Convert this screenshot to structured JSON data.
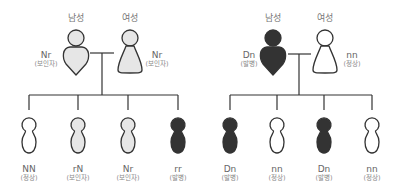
{
  "colors": {
    "stroke": "#333333",
    "affected": "#333333",
    "carrier": "#e6e6e6",
    "normal": "#ffffff",
    "text": "#666666"
  },
  "families": [
    {
      "id": "left",
      "parents": {
        "male": {
          "sex_label": "남성",
          "genotype": "Nr",
          "status": "(보인자)",
          "fill": "carrier"
        },
        "female": {
          "sex_label": "여성",
          "genotype": "Nr",
          "status": "(보인자)",
          "fill": "carrier"
        }
      },
      "children": [
        {
          "genotype": "NN",
          "status": "(정상)",
          "fill": "normal"
        },
        {
          "genotype": "rN",
          "status": "(보인자)",
          "fill": "carrier"
        },
        {
          "genotype": "Nr",
          "status": "(보인자)",
          "fill": "carrier"
        },
        {
          "genotype": "rr",
          "status": "(발병)",
          "fill": "affected"
        }
      ]
    },
    {
      "id": "right",
      "parents": {
        "male": {
          "sex_label": "남성",
          "genotype": "Dn",
          "status": "(발병)",
          "fill": "affected"
        },
        "female": {
          "sex_label": "여성",
          "genotype": "nn",
          "status": "(정상)",
          "fill": "normal"
        }
      },
      "children": [
        {
          "genotype": "Dn",
          "status": "(발병)",
          "fill": "affected"
        },
        {
          "genotype": "nn",
          "status": "(정상)",
          "fill": "normal"
        },
        {
          "genotype": "Dn",
          "status": "(발병)",
          "fill": "affected"
        },
        {
          "genotype": "nn",
          "status": "(정상)",
          "fill": "normal"
        }
      ]
    }
  ]
}
